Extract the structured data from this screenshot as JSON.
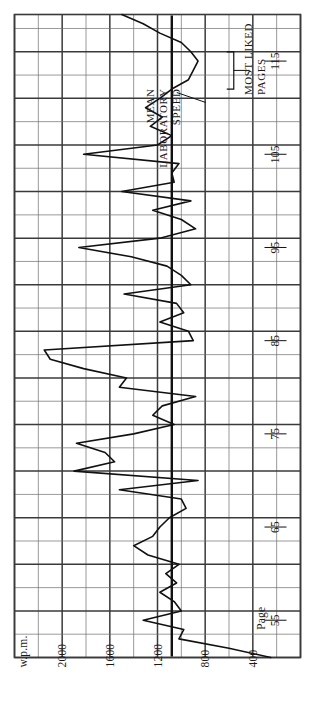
{
  "figure": {
    "orientation": "rotated-90",
    "background_color": "#ffffff",
    "line_color": "#111111",
    "grid_color": "#6e6e6e",
    "grid_major_color": "#3a3a3a"
  },
  "axes": {
    "value_axis": {
      "unit_label": "w.p.m.",
      "ticks": [
        "2000",
        "1600",
        "1200",
        "800",
        "400"
      ],
      "tick_values": [
        2000,
        1600,
        1200,
        800,
        400
      ],
      "range": [
        0,
        2400
      ]
    },
    "category_axis": {
      "unit_label": "Page",
      "ticks": [
        "55",
        "65",
        "75",
        "85",
        "95",
        "105",
        "115"
      ],
      "tick_values": [
        55,
        65,
        75,
        85,
        95,
        105,
        115
      ],
      "range": [
        51,
        120
      ]
    }
  },
  "annotations": {
    "mean_line": {
      "label_lines": [
        "MEAN",
        "LABORATORY",
        "SPEED"
      ],
      "value": 1080
    },
    "most_liked": {
      "label_lines": [
        "MOST LIKED",
        "PAGES"
      ],
      "page_start": 112,
      "page_end": 116
    }
  },
  "chart_data": {
    "type": "line",
    "title": "",
    "subtitle": "",
    "xlabel": "Page",
    "ylabel": "w.p.m.",
    "xlim": [
      51,
      120
    ],
    "ylim": [
      0,
      2400
    ],
    "grid": true,
    "legend": null,
    "orientation": "horizontal-rotated",
    "series": [
      {
        "name": "Reading speed",
        "x": [
          51,
          52,
          53,
          54,
          55,
          56,
          57,
          58,
          59,
          60,
          61,
          62,
          63,
          64,
          65,
          66,
          67,
          68,
          69,
          70,
          71,
          72,
          73,
          74,
          75,
          76,
          77,
          78,
          79,
          80,
          81,
          82,
          83,
          84,
          85,
          86,
          87,
          88,
          89,
          90,
          91,
          92,
          93,
          94,
          95,
          96,
          97,
          98,
          99,
          100,
          101,
          102,
          103,
          104,
          105,
          106,
          107,
          108,
          109,
          110,
          111,
          112,
          113,
          114,
          115,
          116,
          117,
          118,
          119,
          120
        ],
        "values": [
          250,
          600,
          1020,
          980,
          1320,
          1000,
          1060,
          1180,
          1040,
          1130,
          1020,
          1280,
          1400,
          1240,
          1180,
          1100,
          960,
          1000,
          1520,
          860,
          1900,
          1560,
          1640,
          1880,
          1400,
          1060,
          1240,
          1160,
          880,
          1520,
          1460,
          1820,
          2100,
          2150,
          900,
          940,
          1180,
          980,
          1040,
          1480,
          920,
          1000,
          1120,
          1420,
          1860,
          1180,
          880,
          1000,
          1240,
          920,
          1500,
          1060,
          1080,
          1020,
          1820,
          1200,
          1080,
          1260,
          1160,
          1300,
          1180,
          1080,
          940,
          900,
          860,
          920,
          1000,
          1180,
          1320,
          1500
        ]
      }
    ],
    "reference_lines": [
      {
        "name": "MEAN LABORATORY SPEED",
        "axis": "value",
        "value": 1080
      }
    ]
  }
}
